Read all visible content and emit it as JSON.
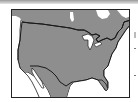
{
  "map": {
    "title": "",
    "region": "North America (United States highlighted)",
    "colors": {
      "land": "#8e8e8e",
      "outline": "#1a1a1a",
      "water": "#ffffff",
      "frame": "#222222"
    },
    "features": [
      {
        "name": "us-canada-border"
      },
      {
        "name": "us-mexico-border"
      },
      {
        "name": "great-lakes"
      },
      {
        "name": "florida-peninsula"
      },
      {
        "name": "baja-california"
      },
      {
        "name": "hudson-bay"
      }
    ]
  }
}
